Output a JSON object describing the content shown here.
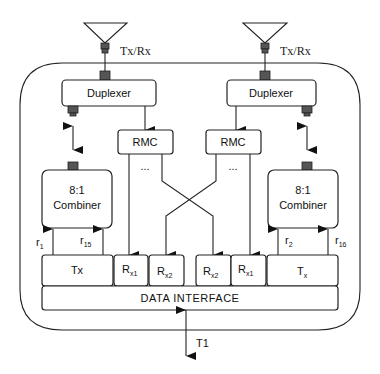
{
  "diagram": {
    "antenna_label_left": "Tx/Rx",
    "antenna_label_right": "Tx/Rx",
    "duplexer_left": "Duplexer",
    "duplexer_right": "Duplexer",
    "rmc_left": "RMC",
    "rmc_right": "RMC",
    "ellipsis_left": "...",
    "ellipsis_right": "...",
    "combiner_left": {
      "line1": "8:1",
      "line2": "Combiner"
    },
    "combiner_right": {
      "line1": "8:1",
      "line2": "Combiner"
    },
    "inputs_left": [
      {
        "base": "r",
        "sub": "1"
      },
      {
        "base": "r",
        "sub": "15"
      }
    ],
    "inputs_right": [
      {
        "base": "r",
        "sub": "2"
      },
      {
        "base": "r",
        "sub": "16"
      }
    ],
    "bottom_row": [
      {
        "base": "Tx",
        "sub": ""
      },
      {
        "base": "R",
        "sub": "x1"
      },
      {
        "base": "R",
        "sub": "x2"
      },
      {
        "base": "R",
        "sub": "x2"
      },
      {
        "base": "R",
        "sub": "x1"
      },
      {
        "base": "T",
        "sub": "x"
      }
    ],
    "data_interface": "DATA INTERFACE",
    "t1_label": "T1"
  }
}
